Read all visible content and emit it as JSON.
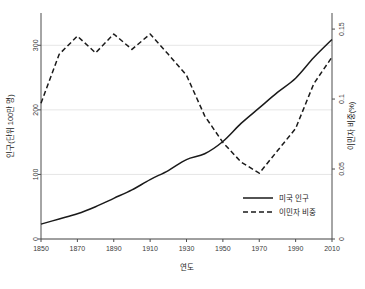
{
  "figure": {
    "clipped_title_ghost": "",
    "background_color": "#ffffff",
    "line_color": "#1a1a1a",
    "grid_color": "#e6e6e6",
    "axis_color": "#4d4d4d"
  },
  "chart_data": {
    "type": "line",
    "title": "",
    "xlabel": "연도",
    "ylabel": "인구(단위 100만 명)",
    "y2label": "이민자 비중(%)",
    "xlim": [
      1850,
      2010
    ],
    "ylim": [
      0,
      350
    ],
    "y2lim": [
      0,
      0.1615
    ],
    "grid": true,
    "legend_position": "bottom-right",
    "x": [
      1850,
      1860,
      1870,
      1880,
      1890,
      1900,
      1910,
      1920,
      1930,
      1940,
      1950,
      1960,
      1970,
      1980,
      1990,
      2000,
      2010
    ],
    "xticks": [
      1850,
      1870,
      1890,
      1910,
      1930,
      1950,
      1970,
      1990,
      2010
    ],
    "xtick_labels": [
      "1850",
      "1870",
      "1890",
      "1910",
      "1930",
      "1950",
      "1970",
      "1990",
      "2010"
    ],
    "yticks": [
      0,
      100,
      200,
      300
    ],
    "ytick_labels": [
      "0",
      "100",
      "200",
      "300"
    ],
    "y2ticks": [
      0,
      0.05,
      0.1,
      0.15
    ],
    "y2tick_labels": [
      "0",
      "0.05",
      "0.1",
      "0.15"
    ],
    "series": [
      {
        "name": "미국 인구",
        "axis": "left",
        "style": "solid",
        "color": "#1a1a1a",
        "units": "100만 명",
        "values": [
          23,
          31,
          39,
          50,
          63,
          76,
          92,
          106,
          123,
          132,
          151,
          179,
          203,
          227,
          249,
          281,
          309
        ]
      },
      {
        "name": "이민자 비중",
        "axis": "right",
        "style": "dashed",
        "color": "#1a1a1a",
        "units": "%",
        "values": [
          0.097,
          0.132,
          0.145,
          0.133,
          0.1465,
          0.1355,
          0.1465,
          0.132,
          0.117,
          0.088,
          0.069,
          0.055,
          0.047,
          0.063,
          0.079,
          0.111,
          0.13
        ]
      }
    ],
    "annotations": []
  },
  "legend": {
    "entries": [
      {
        "label": "미국 인구",
        "style": "solid"
      },
      {
        "label": "이민자 비중",
        "style": "dashed"
      }
    ]
  }
}
